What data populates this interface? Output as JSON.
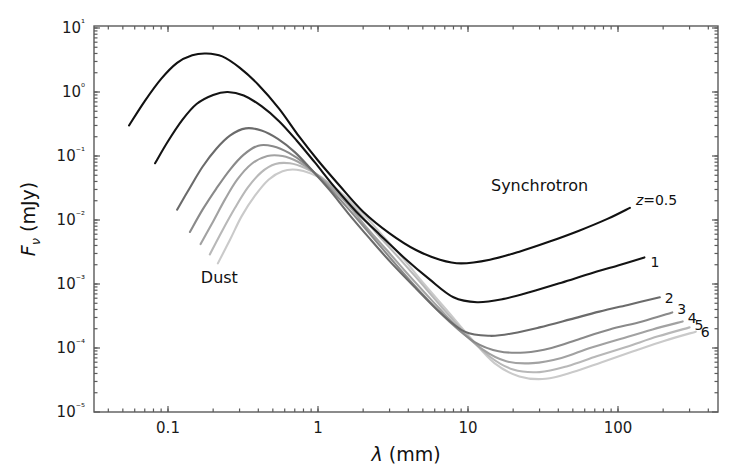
{
  "chart_data": {
    "type": "line",
    "title": "",
    "xlabel": "λ (mm)",
    "ylabel": "Fν (mJy)",
    "xscale": "log",
    "yscale": "log",
    "xlim": [
      0.04,
      500
    ],
    "ylim": [
      1e-05,
      10
    ],
    "xticks": [
      "0.1",
      "1",
      "10",
      "100"
    ],
    "xtick_values": [
      0.1,
      1,
      10,
      100
    ],
    "yticks": [
      "10⁻⁵",
      "10⁻⁴",
      "10⁻³",
      "10⁻²",
      "10⁻¹",
      "10⁰",
      "10¹"
    ],
    "ytick_values": [
      1e-05,
      0.0001,
      0.001,
      0.01,
      0.1,
      1,
      10
    ],
    "grid": false,
    "legend": "none",
    "annotations": [
      {
        "text": "Synchrotron",
        "x": 30.0,
        "y": 0.035
      },
      {
        "text": "Dust",
        "x": 0.22,
        "y": 0.0013
      }
    ],
    "series": [
      {
        "name": "z=0.5",
        "label": "z=0.5",
        "color": "#111111",
        "dust_peak_lambda": 0.18,
        "dust_peak_flux": 4.0,
        "sync_min_lambda": 8.0,
        "sync_min_flux": 0.0021,
        "x_start": 0.055,
        "x_end": 120,
        "y_start": 0.3,
        "y_end": 0.018,
        "points_x": [
          0.055,
          0.07,
          0.09,
          0.115,
          0.145,
          0.18,
          0.23,
          0.3,
          0.4,
          0.55,
          0.75,
          1.0,
          1.4,
          2.0,
          3.0,
          4.5,
          6.5,
          9.0,
          14,
          22,
          35,
          55,
          85,
          120
        ],
        "points_y": [
          0.3,
          0.72,
          1.6,
          2.85,
          3.75,
          4.0,
          3.6,
          2.4,
          1.3,
          0.55,
          0.2,
          0.085,
          0.034,
          0.0135,
          0.0062,
          0.0034,
          0.0024,
          0.0021,
          0.0024,
          0.0032,
          0.0046,
          0.0068,
          0.0104,
          0.0155
        ]
      },
      {
        "name": "z=1",
        "label": "1",
        "color": "#141414",
        "dust_peak_lambda": 0.25,
        "dust_peak_flux": 1.0,
        "sync_min_lambda": 8.0,
        "sync_min_flux": 0.00052,
        "x_start": 0.082,
        "x_end": 150,
        "y_start": 0.077,
        "y_end": 0.0019,
        "points_x": [
          0.082,
          0.1,
          0.125,
          0.155,
          0.2,
          0.25,
          0.32,
          0.42,
          0.55,
          0.72,
          0.95,
          1.3,
          1.8,
          2.6,
          3.8,
          5.5,
          8.0,
          11.5,
          17,
          26,
          42,
          65,
          100,
          150
        ],
        "points_y": [
          0.077,
          0.17,
          0.37,
          0.65,
          0.9,
          1.0,
          0.88,
          0.6,
          0.35,
          0.175,
          0.08,
          0.032,
          0.0135,
          0.0058,
          0.0025,
          0.0012,
          0.00062,
          0.00052,
          0.00058,
          0.00075,
          0.00105,
          0.00145,
          0.00195,
          0.0026
        ]
      },
      {
        "name": "z=2",
        "label": "2",
        "color": "#6b6b6b",
        "dust_peak_lambda": 0.33,
        "dust_peak_flux": 0.27,
        "sync_min_lambda": 11.0,
        "sync_min_flux": 0.000155,
        "x_start": 0.115,
        "x_end": 190,
        "y_start": 0.0145,
        "y_end": 0.00055,
        "points_x": [
          0.115,
          0.14,
          0.17,
          0.21,
          0.26,
          0.33,
          0.42,
          0.54,
          0.7,
          0.9,
          1.2,
          1.6,
          2.2,
          3.1,
          4.5,
          6.5,
          9.5,
          14,
          20,
          30,
          48,
          75,
          120,
          190
        ],
        "points_y": [
          0.0145,
          0.032,
          0.068,
          0.13,
          0.21,
          0.27,
          0.25,
          0.185,
          0.115,
          0.062,
          0.029,
          0.0125,
          0.0052,
          0.0021,
          0.00085,
          0.00036,
          0.00018,
          0.000155,
          0.00017,
          0.00021,
          0.00028,
          0.00037,
          0.00048,
          0.00062
        ]
      },
      {
        "name": "z=3",
        "label": "3",
        "color": "#8a8a8a",
        "dust_peak_lambda": 0.4,
        "dust_peak_flux": 0.145,
        "sync_min_lambda": 14.0,
        "sync_min_flux": 8.5e-05,
        "x_start": 0.14,
        "x_end": 230,
        "y_start": 0.0065,
        "y_end": 0.00036,
        "points_x": [
          0.14,
          0.17,
          0.21,
          0.26,
          0.32,
          0.4,
          0.5,
          0.64,
          0.82,
          1.05,
          1.4,
          1.9,
          2.6,
          3.6,
          5.2,
          7.5,
          11,
          16,
          24,
          36,
          56,
          88,
          145,
          230
        ],
        "points_y": [
          0.0065,
          0.0145,
          0.031,
          0.062,
          0.105,
          0.145,
          0.142,
          0.112,
          0.075,
          0.043,
          0.021,
          0.0093,
          0.0039,
          0.0016,
          0.00062,
          0.00026,
          0.000125,
          8.9e-05,
          8.5e-05,
          0.0001,
          0.00014,
          0.000195,
          0.00026,
          0.00036
        ]
      },
      {
        "name": "z=4",
        "label": "4",
        "color": "#a2a2a2",
        "dust_peak_lambda": 0.46,
        "dust_peak_flux": 0.1,
        "sync_min_lambda": 17.0,
        "sync_min_flux": 5.8e-05,
        "x_start": 0.165,
        "x_end": 270,
        "y_start": 0.0042,
        "y_end": 0.00026,
        "points_x": [
          0.165,
          0.2,
          0.24,
          0.29,
          0.36,
          0.46,
          0.58,
          0.73,
          0.92,
          1.2,
          1.6,
          2.1,
          2.9,
          4.0,
          5.8,
          8.5,
          12.5,
          18,
          27,
          42,
          65,
          105,
          170,
          270
        ],
        "points_y": [
          0.0042,
          0.0095,
          0.021,
          0.043,
          0.075,
          0.1,
          0.1,
          0.082,
          0.058,
          0.034,
          0.017,
          0.0077,
          0.0033,
          0.0014,
          0.00054,
          0.00021,
          9.5e-05,
          6.2e-05,
          5.8e-05,
          7e-05,
          0.0001,
          0.00014,
          0.000195,
          0.00026
        ]
      },
      {
        "name": "z=5",
        "label": "5",
        "color": "#b8b8b8",
        "dust_peak_lambda": 0.52,
        "dust_peak_flux": 0.075,
        "sync_min_lambda": 20.0,
        "sync_min_flux": 4.2e-05,
        "x_start": 0.19,
        "x_end": 300,
        "y_start": 0.0029,
        "y_end": 0.00021,
        "points_x": [
          0.19,
          0.23,
          0.28,
          0.34,
          0.42,
          0.52,
          0.65,
          0.82,
          1.05,
          1.35,
          1.8,
          2.4,
          3.3,
          4.6,
          6.6,
          9.6,
          14,
          20,
          30,
          46,
          72,
          115,
          185,
          300
        ],
        "points_y": [
          0.0029,
          0.0068,
          0.0155,
          0.032,
          0.056,
          0.075,
          0.077,
          0.065,
          0.047,
          0.028,
          0.0145,
          0.0066,
          0.0029,
          0.0012,
          0.00045,
          0.00017,
          7.3e-05,
          4.6e-05,
          4.2e-05,
          5.2e-05,
          7.4e-05,
          0.000105,
          0.000152,
          0.00021
        ]
      },
      {
        "name": "z=6",
        "label": "6",
        "color": "#cacaca",
        "dust_peak_lambda": 0.58,
        "dust_peak_flux": 0.058,
        "sync_min_lambda": 23.0,
        "sync_min_flux": 3.3e-05,
        "x_start": 0.215,
        "x_end": 330,
        "y_start": 0.0021,
        "y_end": 0.00018,
        "points_x": [
          0.215,
          0.26,
          0.31,
          0.38,
          0.47,
          0.58,
          0.72,
          0.9,
          1.15,
          1.5,
          2.0,
          2.7,
          3.7,
          5.1,
          7.3,
          10.5,
          15,
          22,
          33,
          50,
          78,
          125,
          205,
          330
        ],
        "points_y": [
          0.0021,
          0.005,
          0.0115,
          0.024,
          0.043,
          0.058,
          0.061,
          0.053,
          0.039,
          0.024,
          0.0125,
          0.0057,
          0.0025,
          0.001,
          0.00038,
          0.00014,
          5.8e-05,
          3.6e-05,
          3.3e-05,
          4.2e-05,
          6e-05,
          8.8e-05,
          0.00013,
          0.00018
        ]
      }
    ]
  },
  "axes": {
    "x_title_lambda": "λ",
    "x_title_unit": "(mm)",
    "y_title_F": "F",
    "y_title_nu": "ν",
    "y_title_unit": "(mJy)"
  },
  "labels": {
    "synchrotron": "Synchrotron",
    "dust": "Dust"
  }
}
